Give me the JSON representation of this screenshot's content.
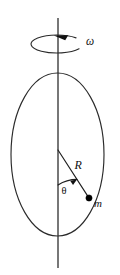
{
  "figure": {
    "background_color": "#ffffff",
    "width": 120,
    "height": 275,
    "ink_color": "#1f1f1f",
    "axis_color": "#4a4a4a"
  },
  "labels": {
    "angular_velocity": "ω",
    "radius": "R",
    "angle": "θ",
    "mass": "m"
  },
  "elements": {
    "rotation_axis": {
      "name": "vertical rotation axis",
      "x": 58,
      "y_top": 18,
      "y_bottom": 268
    },
    "spin_indicator": {
      "name": "rotation direction ellipse with arrowhead",
      "cx": 57,
      "cy": 44,
      "rx": 26,
      "ry": 9,
      "arrow_at": "top-right",
      "direction": "counterclockwise"
    },
    "hoop": {
      "name": "circular hoop drawn as ellipse",
      "cx": 57.5,
      "cy": 154.5,
      "rx": 46.5,
      "ry": 81.5
    },
    "radius_line": {
      "name": "radius from hoop center to bead",
      "x1": 58,
      "y1": 150,
      "x2": 89,
      "y2": 198
    },
    "angle_arc": {
      "name": "theta angle arc with arrowhead",
      "from": "horizontal axis direction",
      "to": "radius line",
      "arrow_at": "radius line end"
    },
    "bead": {
      "name": "point mass on hoop",
      "cx": 89,
      "cy": 198,
      "r": 3.1
    }
  },
  "label_positions": {
    "omega": {
      "x": 86,
      "y": 45
    },
    "R": {
      "x": 74.5,
      "y": 169
    },
    "theta": {
      "x": 61.5,
      "y": 193.5
    },
    "m": {
      "x": 94,
      "y": 207
    }
  }
}
